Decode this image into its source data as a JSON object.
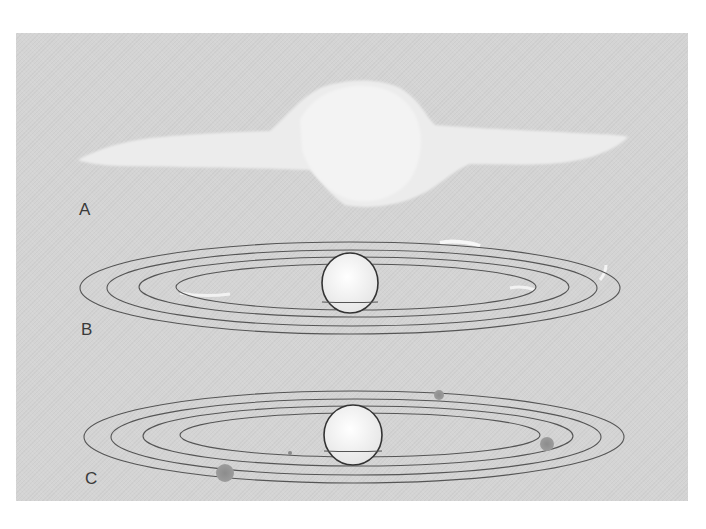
{
  "figure": {
    "panels": [
      {
        "id": "A",
        "label": "A",
        "description": "Flattened cloud of gas and dust (solar nebula)"
      },
      {
        "id": "B",
        "label": "B",
        "description": "Central sphere with concentric elliptical rings of material"
      },
      {
        "id": "C",
        "label": "C",
        "description": "Central sphere with concentric elliptical orbits and small planetary bodies"
      }
    ],
    "colors": {
      "background": "#d4d4d4",
      "cloud": "#ececec",
      "orbit_stroke": "#555555",
      "sphere_fill": "#f2f2f2",
      "sphere_stroke": "#333333",
      "planet_fill": "#8a8a8a"
    }
  }
}
